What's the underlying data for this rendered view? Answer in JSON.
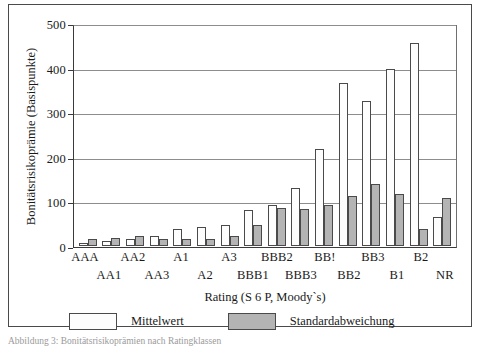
{
  "figure": {
    "caption": "Abbildung  3: Bonitätsrisikoprämien nach Ratingklassen"
  },
  "legend": {
    "position": "bottom",
    "items": [
      {
        "label": "Mittelwert",
        "color": "#fdfdfd"
      },
      {
        "label": "Standardabweichung",
        "color": "#b4b4b4"
      }
    ]
  },
  "chart_data": {
    "type": "bar",
    "title": "",
    "xlabel": "Rating (S 6 P, Moody`s)",
    "ylabel": "Bonitätsrisikoprämie (Basispunkte)",
    "ylim": [
      0,
      500
    ],
    "yticks": [
      0,
      100,
      200,
      300,
      400,
      500
    ],
    "ytick_labels": [
      "0",
      "100",
      "200",
      "300",
      "400",
      "500"
    ],
    "grid": true,
    "legend_position": "bottom",
    "categories": [
      "AAA",
      "AA1",
      "AA2",
      "AA3",
      "A1",
      "A2",
      "A3",
      "BBB1",
      "BBB2",
      "BBB3",
      "BB!",
      "BB2",
      "BB3",
      "B1",
      "B2",
      "NR"
    ],
    "series": [
      {
        "name": "Mittelwert",
        "color": "#fdfdfd",
        "values": [
          7,
          11,
          15,
          23,
          38,
          42,
          48,
          80,
          91,
          131,
          217,
          366,
          326,
          396,
          456,
          66
        ]
      },
      {
        "name": "Standardabweichung",
        "color": "#b4b4b4",
        "values": [
          16,
          17,
          22,
          16,
          16,
          15,
          23,
          46,
          86,
          82,
          92,
          113,
          139,
          116,
          39,
          107
        ]
      }
    ]
  }
}
